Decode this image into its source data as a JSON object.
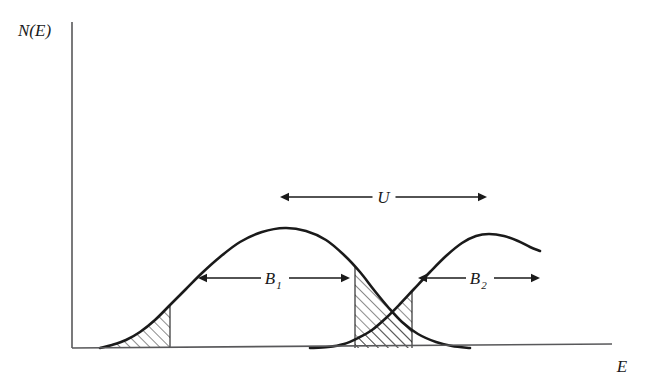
{
  "figure": {
    "background_color": "#ffffff",
    "curve_color": "#1a1a1a",
    "axis_color": "#58585a",
    "hatch_color": "#2b2b2b",
    "axes": {
      "y_label": "N(E)",
      "x_label": "E",
      "origin_x": 72,
      "origin_y": 348,
      "y_top": 22,
      "x_right": 612
    },
    "annotations": [
      {
        "name": "U",
        "label": "U",
        "subscript": "",
        "x1": 280,
        "x2": 487,
        "y": 197
      },
      {
        "name": "B1",
        "label": "B",
        "subscript": "1",
        "x1": 198,
        "x2": 350,
        "y": 278
      },
      {
        "name": "B2",
        "label": "B",
        "subscript": "2",
        "x1": 418,
        "x2": 540,
        "y": 278
      }
    ],
    "hatched_regions": [
      {
        "name": "left-tail-band",
        "x_start": 100,
        "x_end": 170
      },
      {
        "name": "overlap-band",
        "x_start": 355,
        "x_end": 412
      }
    ]
  },
  "chart_data": {
    "type": "line",
    "title": "",
    "xlabel": "E",
    "ylabel": "N(E)",
    "grid": false,
    "legend": false,
    "xlim": [
      72,
      612
    ],
    "ylim": [
      348,
      22
    ],
    "annotations": [
      {
        "text": "U",
        "meaning": "on-site Coulomb repulsion, separation between the two band centers",
        "span_x": [
          280,
          487
        ],
        "y": 197
      },
      {
        "text": "B_1",
        "meaning": "width of lower Hubbard band",
        "span_x": [
          198,
          350
        ],
        "y": 278
      },
      {
        "text": "B_2",
        "meaning": "width of upper Hubbard band",
        "span_x": [
          418,
          540
        ],
        "y": 278
      }
    ],
    "series": [
      {
        "name": "lower-hubbard-band",
        "description": "Left density-of-states peak N(E)",
        "peak_x": 285,
        "peak_y": 228,
        "start_x": 100,
        "end_x": 470,
        "points": [
          [
            100,
            348
          ],
          [
            112,
            345
          ],
          [
            126,
            340
          ],
          [
            140,
            332
          ],
          [
            155,
            320
          ],
          [
            170,
            305
          ],
          [
            186,
            289
          ],
          [
            202,
            273
          ],
          [
            220,
            257
          ],
          [
            240,
            242
          ],
          [
            262,
            232
          ],
          [
            285,
            228
          ],
          [
            306,
            231
          ],
          [
            326,
            240
          ],
          [
            344,
            255
          ],
          [
            360,
            272
          ],
          [
            374,
            290
          ],
          [
            388,
            307
          ],
          [
            402,
            322
          ],
          [
            418,
            334
          ],
          [
            436,
            342
          ],
          [
            452,
            346
          ],
          [
            470,
            348
          ]
        ]
      },
      {
        "name": "upper-hubbard-band",
        "description": "Right density-of-states peak N(E), truncated at right edge",
        "peak_x": 489,
        "peak_y": 234,
        "start_x": 310,
        "end_x": 540,
        "points": [
          [
            310,
            348
          ],
          [
            328,
            347
          ],
          [
            344,
            344
          ],
          [
            358,
            338
          ],
          [
            372,
            330
          ],
          [
            386,
            318
          ],
          [
            400,
            304
          ],
          [
            414,
            289
          ],
          [
            430,
            272
          ],
          [
            446,
            256
          ],
          [
            462,
            243
          ],
          [
            476,
            236
          ],
          [
            489,
            234
          ],
          [
            504,
            236
          ],
          [
            518,
            241
          ],
          [
            530,
            247
          ],
          [
            540,
            251
          ]
        ]
      }
    ]
  }
}
